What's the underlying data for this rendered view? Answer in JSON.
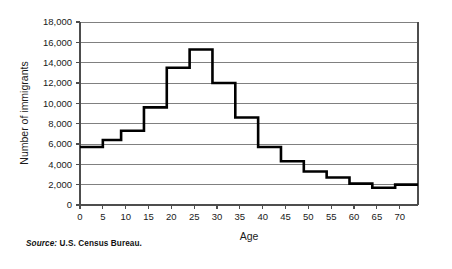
{
  "figure": {
    "source_prefix": "Source:",
    "source_text": "U.S. Census Bureau."
  },
  "chart_data": {
    "type": "line",
    "title": "",
    "subtitle": "",
    "xlabel": "Age",
    "ylabel": "Number of immigrants",
    "xlim": [
      0,
      74
    ],
    "ylim": [
      0,
      18000
    ],
    "grid": true,
    "grid_axis": "y",
    "legend": false,
    "legend_position": "none",
    "line_color": "#000000",
    "line_width": 2.6,
    "gridline_color": "#808080",
    "axis_color": "#4d4d4d",
    "background": "#ffffff",
    "step_style": "post",
    "xticks": [
      0,
      5,
      10,
      15,
      20,
      25,
      30,
      35,
      40,
      45,
      50,
      55,
      60,
      65,
      70
    ],
    "xtick_labels": [
      "0",
      "5",
      "10",
      "15",
      "20",
      "25",
      "30",
      "35",
      "40",
      "45",
      "50",
      "55",
      "60",
      "65",
      "70"
    ],
    "yticks": [
      0,
      2000,
      4000,
      6000,
      8000,
      10000,
      12000,
      14000,
      16000,
      18000
    ],
    "ytick_labels": [
      "0",
      "2,000",
      "4,000",
      "6,000",
      "8,000",
      "10,000",
      "12,000",
      "14,000",
      "16,000",
      "18,000"
    ],
    "series": [
      {
        "name": "Number of immigrants",
        "age_groups": [
          {
            "label": "0-4",
            "x_start": 0,
            "x_end": 5,
            "value": 5700
          },
          {
            "label": "5-9",
            "x_start": 5,
            "x_end": 9,
            "value": 6400
          },
          {
            "label": "10-14",
            "x_start": 9,
            "x_end": 14,
            "value": 7300
          },
          {
            "label": "15-19",
            "x_start": 14,
            "x_end": 19,
            "value": 9600
          },
          {
            "label": "20-24",
            "x_start": 19,
            "x_end": 24,
            "value": 13500
          },
          {
            "label": "25-29",
            "x_start": 24,
            "x_end": 29,
            "value": 15300
          },
          {
            "label": "30-34",
            "x_start": 29,
            "x_end": 34,
            "value": 12000
          },
          {
            "label": "35-39",
            "x_start": 34,
            "x_end": 39,
            "value": 8600
          },
          {
            "label": "40-44",
            "x_start": 39,
            "x_end": 44,
            "value": 5700
          },
          {
            "label": "45-49",
            "x_start": 44,
            "x_end": 49,
            "value": 4300
          },
          {
            "label": "50-54",
            "x_start": 49,
            "x_end": 54,
            "value": 3300
          },
          {
            "label": "55-59",
            "x_start": 54,
            "x_end": 59,
            "value": 2700
          },
          {
            "label": "60-64",
            "x_start": 59,
            "x_end": 64,
            "value": 2100
          },
          {
            "label": "65-69",
            "x_start": 64,
            "x_end": 69,
            "value": 1700
          },
          {
            "label": "70-74",
            "x_start": 69,
            "x_end": 74,
            "value": 2000
          }
        ],
        "x": [
          0,
          5,
          9,
          14,
          19,
          24,
          29,
          34,
          39,
          44,
          49,
          54,
          59,
          64,
          69,
          74
        ],
        "values": [
          5700,
          6400,
          7300,
          9600,
          13500,
          15300,
          12000,
          8600,
          5700,
          4300,
          3300,
          2700,
          2100,
          1700,
          2000,
          2000
        ]
      }
    ]
  }
}
